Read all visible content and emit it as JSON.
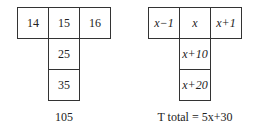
{
  "left_grid": {
    "top_row": [
      "14",
      "15",
      "16"
    ],
    "column": [
      "25",
      "35"
    ],
    "total": "105"
  },
  "right_grid": {
    "top_row": [
      "x−1",
      "x",
      "x+1"
    ],
    "column": [
      "x+10",
      "x+20"
    ],
    "total": "T total = 5x+30"
  }
}
